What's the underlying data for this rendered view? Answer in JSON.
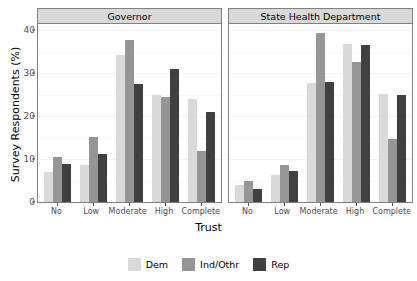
{
  "chart_data": {
    "type": "bar",
    "title": "",
    "xlabel": "Trust",
    "ylabel": "Survey Respondents (%)",
    "categories": [
      "No",
      "Low",
      "Moderate",
      "High",
      "Complete"
    ],
    "ylim": [
      0,
      41.5
    ],
    "yticks": [
      0,
      10,
      20,
      30,
      40
    ],
    "ytick_labels": [
      "0",
      "10",
      "20",
      "30",
      "40"
    ],
    "grid": true,
    "legend_position": "bottom",
    "facet_variable": "institution",
    "facets": [
      {
        "label": "Governor",
        "series": [
          {
            "name": "Dem",
            "color": "#d9d9d9",
            "values": [
              6.9,
              8.6,
              34.2,
              25.0,
              24.0
            ]
          },
          {
            "name": "Ind/Othr",
            "color": "#969696",
            "values": [
              10.5,
              15.1,
              37.8,
              24.6,
              11.9
            ]
          },
          {
            "name": "Rep",
            "color": "#404040",
            "values": [
              8.9,
              11.3,
              27.6,
              31.0,
              21.0
            ]
          }
        ]
      },
      {
        "label": "State Health Department",
        "series": [
          {
            "name": "Dem",
            "color": "#d9d9d9",
            "values": [
              3.9,
              6.2,
              27.8,
              36.8,
              25.1
            ]
          },
          {
            "name": "Ind/Othr",
            "color": "#969696",
            "values": [
              5.0,
              8.6,
              39.3,
              32.6,
              14.7
            ]
          },
          {
            "name": "Rep",
            "color": "#404040",
            "values": [
              3.1,
              7.3,
              27.9,
              36.6,
              25.0
            ]
          }
        ]
      }
    ],
    "legend": [
      {
        "label": "Dem",
        "color": "#d9d9d9"
      },
      {
        "label": "Ind/Othr",
        "color": "#969696"
      },
      {
        "label": "Rep",
        "color": "#404040"
      }
    ]
  }
}
